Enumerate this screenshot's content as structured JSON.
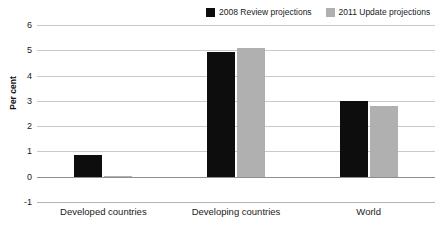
{
  "chart_data": {
    "type": "bar",
    "title": "",
    "xlabel": "",
    "ylabel": "Per cent",
    "categories": [
      "Developed countries",
      "Developing countries",
      "World"
    ],
    "series": [
      {
        "name": "2008 Review projections",
        "color": "#0d0d0d",
        "values": [
          0.85,
          4.95,
          3.0
        ]
      },
      {
        "name": "2011 Update projections",
        "color": "#b0b0b0",
        "values": [
          0.03,
          5.1,
          2.8
        ]
      }
    ],
    "ylim": [
      -1,
      6
    ],
    "yticks": [
      6,
      5,
      4,
      3,
      2,
      1,
      0,
      -1
    ],
    "ytick_labels": [
      "6",
      "5",
      "4",
      "3",
      "2",
      "1",
      "0",
      "-1"
    ],
    "grid": true,
    "legend_position": "top-right"
  },
  "legend": {
    "entries": [
      {
        "label": "2008 Review projections",
        "swatch": "black-square-swatch"
      },
      {
        "label": "2011 Update projections",
        "swatch": "gray-square-swatch"
      }
    ]
  },
  "axis": {
    "y_title": "Per cent"
  }
}
